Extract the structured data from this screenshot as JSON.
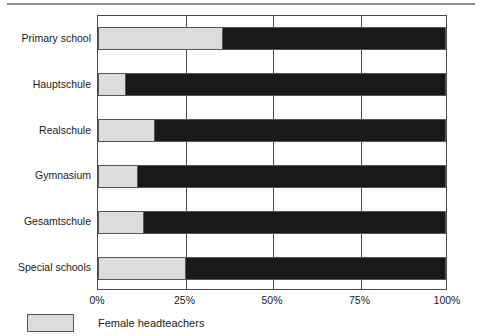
{
  "chart_data": {
    "type": "bar",
    "orientation": "horizontal",
    "stacked": true,
    "normalized": true,
    "title": "",
    "subtitle": "",
    "xlabel": "",
    "ylabel": "",
    "xlim": [
      0,
      100
    ],
    "xticks": [
      0,
      25,
      50,
      75,
      100
    ],
    "xtick_labels": [
      "0%",
      "25%",
      "50%",
      "75%",
      "100%"
    ],
    "grid": true,
    "grid_axis": "x",
    "legend_position": "bottom-left",
    "categories": [
      "Primary school",
      "Hauptschule",
      "Realschule",
      "Gymnasium",
      "Gesamtschule",
      "Special schools"
    ],
    "series": [
      {
        "name": "Female headteachers",
        "color": "#dcdcdc",
        "values": [
          35.7,
          7.7,
          16.3,
          11.4,
          12.9,
          25.0
        ]
      },
      {
        "name": "",
        "color": "#191919",
        "values": [
          64.3,
          92.3,
          83.7,
          88.6,
          87.1,
          75.0
        ]
      }
    ],
    "legend_entries": [
      {
        "label": "Female headteachers",
        "color": "#dcdcdc"
      }
    ]
  },
  "colors": {
    "female": "#dcdcdc",
    "other": "#191919",
    "axis": "#4a4a4a",
    "rule": "#8f8f8f",
    "text": "#1a1a1a"
  }
}
